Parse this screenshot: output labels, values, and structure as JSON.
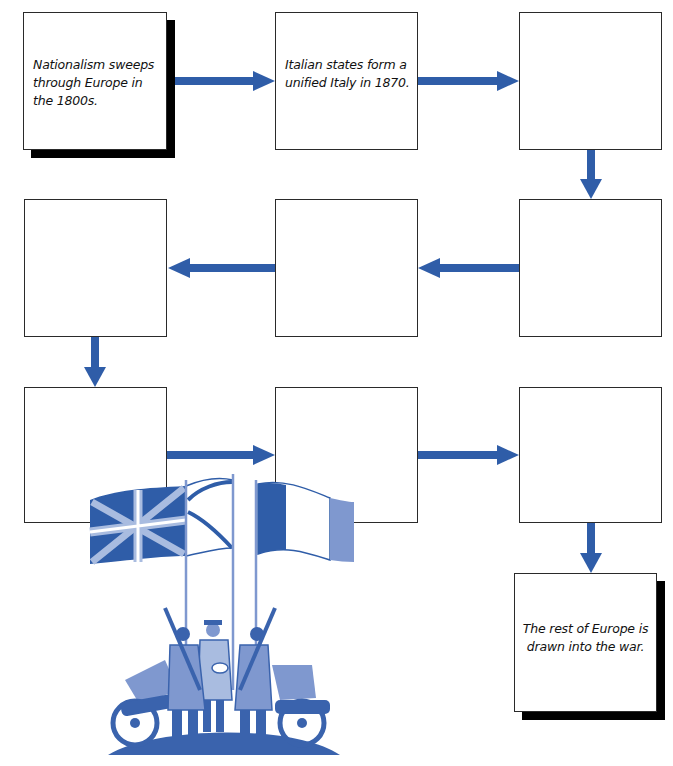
{
  "diagram": {
    "type": "flowchart",
    "arrow_color": "#2f5da8",
    "illustration_color": "#3a63ad",
    "boxes": [
      {
        "id": 1,
        "text": "Nationalism sweeps through Europe in the 1800s.",
        "highlighted": true
      },
      {
        "id": 2,
        "text": "Italian states form a unified Italy in 1870.",
        "highlighted": false
      },
      {
        "id": 3,
        "text": "",
        "highlighted": false
      },
      {
        "id": 4,
        "text": "",
        "highlighted": false
      },
      {
        "id": 5,
        "text": "",
        "highlighted": false
      },
      {
        "id": 6,
        "text": "",
        "highlighted": false
      },
      {
        "id": 7,
        "text": "",
        "highlighted": false
      },
      {
        "id": 8,
        "text": "",
        "highlighted": false
      },
      {
        "id": 9,
        "text": "",
        "highlighted": false
      },
      {
        "id": 10,
        "text": "The rest of Europe is drawn into the war.",
        "highlighted": true
      }
    ],
    "flow": [
      "1→2",
      "2→3",
      "3→4",
      "4→5",
      "5→6",
      "6→7",
      "7→8",
      "8→9",
      "9→10"
    ],
    "illustration": {
      "description": "WWI allied soldiers shaking hands beneath British Union Jack, naval ensign and French tricolor flags, with field cannons on a hill"
    }
  }
}
